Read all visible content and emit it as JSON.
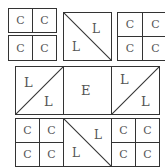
{
  "tiles": {
    "top_left_upper": [
      "C",
      "C"
    ],
    "top_left_lower": [
      "C",
      "C"
    ],
    "top_middle": {
      "upper_right": "L",
      "lower_left": "L"
    },
    "top_right": [
      "C",
      "C",
      "C",
      "C"
    ],
    "middle_left": {
      "upper_left": "L",
      "lower_right": "L"
    },
    "middle_center": "E",
    "middle_right": {
      "upper_left": "L",
      "lower_right": "L"
    },
    "bottom_left": [
      "C",
      "C",
      "C",
      "C"
    ],
    "bottom_middle": {
      "upper_right": "L",
      "lower_left": "L"
    },
    "bottom_right": [
      "C",
      "C",
      "C",
      "C"
    ]
  }
}
